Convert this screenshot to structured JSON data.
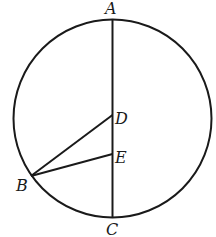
{
  "diagram": {
    "type": "geometry",
    "labels": {
      "A": "A",
      "B": "B",
      "C": "C",
      "D": "D",
      "E": "E"
    },
    "segments": [
      "AC",
      "BD",
      "BE"
    ],
    "colors": {
      "ink": "#1a1a1a",
      "background": "#ffffff"
    }
  }
}
